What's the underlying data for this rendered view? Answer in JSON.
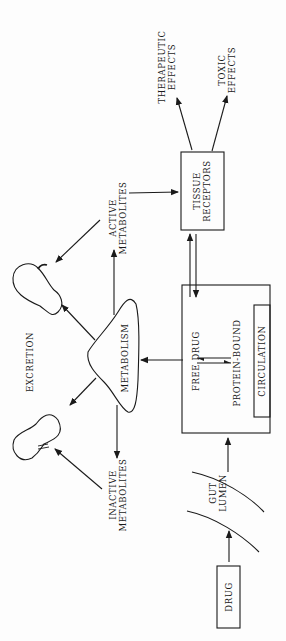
{
  "diagram": {
    "orientation": "rotated -90deg (reads bottom-to-top)",
    "nodes": {
      "drug": "DRUG",
      "gut_lumen": [
        "GUT",
        "LUMEN"
      ],
      "circulation_box": {
        "free_drug": "FREE DRUG",
        "protein_bound": "PROTEIN-BOUND",
        "circulation": "CIRCULATION"
      },
      "tissue_receptors": [
        "TISSUE",
        "RECEPTORS"
      ],
      "therapeutic_effects": [
        "THERAPEUTIC",
        "EFFECTS"
      ],
      "toxic_effects": [
        "TOXIC",
        "EFFECTS"
      ],
      "metabolism": "METABOLISM",
      "active_metabolites": [
        "ACTIVE",
        "METABOLITES"
      ],
      "inactive_metabolites": [
        "INACTIVE",
        "METABOLITES"
      ],
      "excretion": "EXCRETION"
    },
    "edges": [
      {
        "from": "DRUG",
        "to": "GUT LUMEN"
      },
      {
        "from": "GUT LUMEN",
        "to": "CIRCULATION"
      },
      {
        "from": "FREE DRUG",
        "to": "PROTEIN-BOUND",
        "bidirectional": true
      },
      {
        "from": "FREE DRUG",
        "to": "TISSUE RECEPTORS",
        "bidirectional": true
      },
      {
        "from": "FREE DRUG",
        "to": "METABOLISM"
      },
      {
        "from": "METABOLISM",
        "to": "ACTIVE METABOLITES"
      },
      {
        "from": "METABOLISM",
        "to": "INACTIVE METABOLITES"
      },
      {
        "from": "METABOLISM",
        "to": "EXCRETION (kidney 1)"
      },
      {
        "from": "METABOLISM",
        "to": "EXCRETION (kidney 2)"
      },
      {
        "from": "ACTIVE METABOLITES",
        "to": "TISSUE RECEPTORS"
      },
      {
        "from": "ACTIVE METABOLITES",
        "to": "EXCRETION (kidney 1)"
      },
      {
        "from": "INACTIVE METABOLITES",
        "to": "EXCRETION (kidney 2)"
      },
      {
        "from": "TISSUE RECEPTORS",
        "to": "THERAPEUTIC EFFECTS"
      },
      {
        "from": "TISSUE RECEPTORS",
        "to": "TOXIC EFFECTS"
      }
    ]
  }
}
